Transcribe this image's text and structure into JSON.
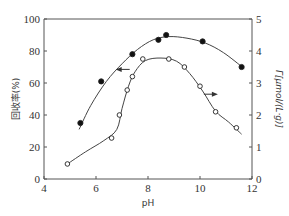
{
  "chart_data": {
    "type": "line",
    "title": "",
    "xlabel": "pH",
    "ylabel_left": "回收率(%)",
    "ylabel_right": "Γ[μmol/(L·g)]",
    "xlim": [
      4,
      12
    ],
    "ylim_left": [
      0,
      100
    ],
    "ylim_right": [
      0,
      5
    ],
    "x_ticks": [
      4,
      6,
      8,
      10,
      12
    ],
    "y_ticks_left": [
      0,
      20,
      40,
      60,
      80,
      100
    ],
    "y_ticks_right": [
      0,
      1,
      2,
      3,
      4,
      5
    ],
    "grid": false,
    "series": [
      {
        "name": "回收率",
        "axis": "left",
        "marker": "filled-circle",
        "arrow": "left",
        "x": [
          5.4,
          6.2,
          7.4,
          8.4,
          8.7,
          10.1,
          11.6
        ],
        "y": [
          35,
          61,
          78,
          87,
          90,
          86,
          70
        ]
      },
      {
        "name": "Γ",
        "axis": "right",
        "marker": "hollow-circle",
        "arrow": "right",
        "x": [
          4.9,
          6.6,
          6.9,
          7.2,
          7.4,
          7.8,
          8.8,
          9.4,
          10.0,
          10.6,
          11.4
        ],
        "y": [
          0.47,
          1.28,
          2.0,
          2.78,
          3.2,
          3.75,
          3.75,
          3.5,
          2.9,
          2.1,
          1.6
        ]
      }
    ]
  },
  "labels": {
    "x_axis": "pH",
    "y_left": "回收率(%)",
    "y_right": "Γ[μmol/(L·g)]"
  }
}
